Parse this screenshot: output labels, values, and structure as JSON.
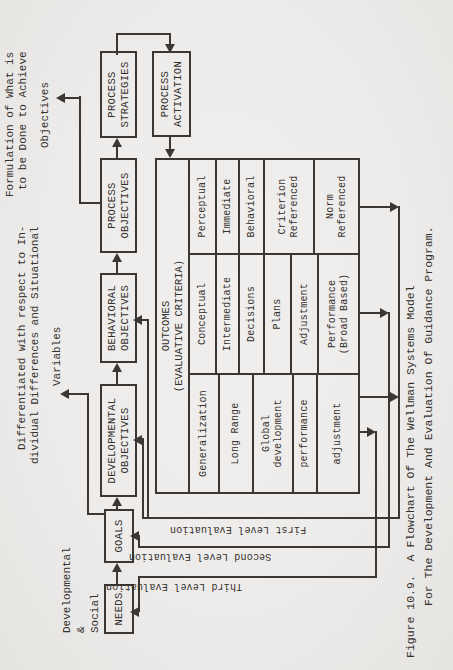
{
  "page": {
    "background": "#edeceb",
    "ink": "#34302c",
    "line_color": "#3a3734"
  },
  "flowchart": {
    "chain_boxes": [
      {
        "label": "NEEDS"
      },
      {
        "label": "GOALS"
      },
      {
        "label": "DEVELOPMENTAL\nOBJECTIVES"
      },
      {
        "label": "BEHAVIORAL\nOBJECTIVES"
      },
      {
        "label": "PROCESS\nOBJECTIVES"
      },
      {
        "label": "PROCESS\nSTRATEGIES"
      }
    ],
    "activation_box": {
      "label": "PROCESS\nACTIVATION"
    }
  },
  "annotations": {
    "needs_note": "Developmental\n&\nSocial",
    "differentiation_note": {
      "line1": "Differentiated with respect to In-",
      "line2": "dividual Differences and Situational",
      "line3": "Variables"
    },
    "formulation_note": {
      "line1": "Formulation of What is",
      "line2": "to be Done to Achieve",
      "line3": "Objectives"
    }
  },
  "outcomes_table": {
    "title_line1": "OUTCOMES",
    "title_line2": "(EVALUATIVE CRITERIA)",
    "col_developmental": [
      "Generalization",
      "Long Range",
      "Global\ndevelopment",
      "performance",
      "adjustment"
    ],
    "col_conceptual": [
      "Conceptual",
      "Intermediate",
      "Decisions",
      "Plans",
      "Adjustment",
      "Performance\n(Broad Based)"
    ],
    "col_perceptual": [
      "Perceptual",
      "Immediate",
      "Behavioral",
      "Criterion\nReferenced",
      "Norm\nReferenced"
    ]
  },
  "evaluation_labels": {
    "first": "First Level Evaluation",
    "second": "Second Level Evaluation",
    "third": "Third Level Evaluation"
  },
  "caption": {
    "line1": "Figure 10.9.  A Flowchart Of The Wellman Systems Model",
    "line2": "For The Development And Evaluation Of Guidance Program."
  }
}
